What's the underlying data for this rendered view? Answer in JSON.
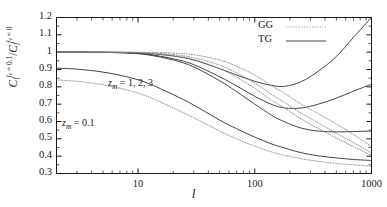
{
  "chart_data": {
    "type": "line",
    "title": "",
    "xlabel": "l",
    "ylabel_parts": {
      "c1": "C",
      "sub1": "l",
      "sup1": "f",
      "sup1b": "v",
      "sup1c": " = 0.1",
      "slash": "/",
      "c2": "C",
      "sub2": "l",
      "sup2": "f",
      "sup2b": "v",
      "sup2c": " = 0"
    },
    "ylabel_plain": "C_l^{f_v = 0.1} / C_l^{f_v = 0}",
    "xscale": "log",
    "yscale": "linear",
    "xlim": [
      2,
      1000
    ],
    "ylim": [
      0.3,
      1.2
    ],
    "grid": false,
    "xticks": [
      10,
      100,
      1000
    ],
    "xticklabels": [
      "10",
      "100",
      "1000"
    ],
    "yticks": [
      0.3,
      0.4,
      0.5,
      0.6,
      0.7,
      0.8,
      0.9,
      1.0,
      1.1,
      1.2
    ],
    "yticklabels": [
      "0.3",
      "0.4",
      "0.5",
      "0.6",
      "0.7",
      "0.8",
      "0.9",
      "1",
      "1.1",
      "1.2"
    ],
    "legend": {
      "position": "top-right",
      "entries": [
        {
          "name": "GG",
          "style": "dotted"
        },
        {
          "name": "TG",
          "style": "solid"
        }
      ]
    },
    "annotations": [
      {
        "text_parts": {
          "z": "z",
          "sub": "m",
          "rest": " = 1, 2, 3"
        },
        "text": "z_m = 1, 2, 3",
        "x_px": 108,
        "y_px": 77
      },
      {
        "text_parts": {
          "z": "z",
          "sub": "m",
          "rest": " = 0.1"
        },
        "text": "z_m = 0.1",
        "x_px": 62,
        "y_px": 117
      }
    ],
    "series": [
      {
        "name": "TG z_m=1",
        "group": "TG",
        "style": "solid",
        "x": [
          2,
          3,
          5,
          8,
          12,
          20,
          30,
          50,
          70,
          100,
          140,
          180,
          250,
          350,
          500,
          700,
          1000
        ],
        "y": [
          1.0,
          1.0,
          1.0,
          0.998,
          0.993,
          0.978,
          0.955,
          0.905,
          0.868,
          0.832,
          0.808,
          0.803,
          0.83,
          0.89,
          0.975,
          1.085,
          1.2
        ]
      },
      {
        "name": "TG z_m=2",
        "group": "TG",
        "style": "solid",
        "x": [
          2,
          3,
          5,
          8,
          12,
          20,
          30,
          50,
          70,
          100,
          140,
          180,
          250,
          350,
          500,
          700,
          1000
        ],
        "y": [
          1.0,
          1.0,
          0.999,
          0.996,
          0.988,
          0.962,
          0.928,
          0.858,
          0.805,
          0.745,
          0.698,
          0.678,
          0.678,
          0.7,
          0.735,
          0.775,
          0.815
        ]
      },
      {
        "name": "TG z_m=3",
        "group": "TG",
        "style": "solid",
        "x": [
          2,
          3,
          5,
          8,
          12,
          20,
          30,
          50,
          70,
          100,
          140,
          180,
          250,
          350,
          500,
          700,
          1000
        ],
        "y": [
          1.0,
          1.0,
          0.999,
          0.995,
          0.985,
          0.955,
          0.915,
          0.835,
          0.772,
          0.7,
          0.635,
          0.598,
          0.562,
          0.545,
          0.54,
          0.542,
          0.545
        ]
      },
      {
        "name": "TG z_m=0.1",
        "group": "TG",
        "style": "solid",
        "x": [
          2,
          3,
          5,
          8,
          12,
          20,
          30,
          50,
          70,
          100,
          140,
          180,
          250,
          350,
          500,
          700,
          1000
        ],
        "y": [
          0.908,
          0.902,
          0.885,
          0.858,
          0.822,
          0.755,
          0.695,
          0.608,
          0.558,
          0.51,
          0.47,
          0.447,
          0.42,
          0.402,
          0.39,
          0.381,
          0.375
        ]
      },
      {
        "name": "GG z_m=1",
        "group": "GG",
        "style": "dotted",
        "x": [
          2,
          3,
          5,
          8,
          12,
          20,
          30,
          50,
          70,
          100,
          140,
          180,
          250,
          350,
          500,
          700,
          1000
        ],
        "y": [
          1.0,
          1.0,
          1.0,
          1.0,
          0.999,
          0.995,
          0.985,
          0.955,
          0.918,
          0.868,
          0.805,
          0.762,
          0.7,
          0.645,
          0.585,
          0.525,
          0.455
        ]
      },
      {
        "name": "GG z_m=2",
        "group": "GG",
        "style": "dotted",
        "x": [
          2,
          3,
          5,
          8,
          12,
          20,
          30,
          50,
          70,
          100,
          140,
          180,
          250,
          350,
          500,
          700,
          1000
        ],
        "y": [
          1.0,
          1.0,
          1.0,
          0.999,
          0.996,
          0.986,
          0.968,
          0.925,
          0.88,
          0.822,
          0.755,
          0.71,
          0.648,
          0.592,
          0.532,
          0.478,
          0.42
        ]
      },
      {
        "name": "GG z_m=3",
        "group": "GG",
        "style": "dotted",
        "x": [
          2,
          3,
          5,
          8,
          12,
          20,
          30,
          50,
          70,
          100,
          140,
          180,
          250,
          350,
          500,
          700,
          1000
        ],
        "y": [
          1.0,
          1.0,
          1.0,
          0.998,
          0.994,
          0.98,
          0.958,
          0.905,
          0.855,
          0.792,
          0.722,
          0.678,
          0.615,
          0.56,
          0.505,
          0.455,
          0.405
        ]
      },
      {
        "name": "GG z_m=0.1",
        "group": "GG",
        "style": "dotted",
        "x": [
          2,
          3,
          5,
          8,
          12,
          20,
          30,
          50,
          70,
          100,
          140,
          180,
          250,
          350,
          500,
          700,
          1000
        ],
        "y": [
          0.84,
          0.832,
          0.812,
          0.782,
          0.745,
          0.678,
          0.622,
          0.545,
          0.5,
          0.458,
          0.424,
          0.405,
          0.385,
          0.37,
          0.358,
          0.35,
          0.342
        ]
      }
    ],
    "colors": {
      "axis": "#1a1a1a",
      "tg_line": "#3a3a3a",
      "gg_line": "#8a8a8a",
      "background": "#ffffff"
    }
  }
}
